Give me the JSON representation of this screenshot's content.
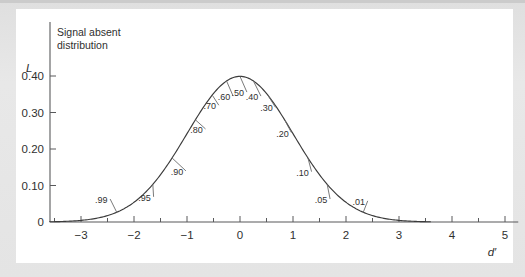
{
  "figure": {
    "title_line1": "Signal absent",
    "title_line2": "distribution",
    "background_color": "#e6e6e6",
    "panel_color": "#ffffff",
    "curve_color": "#3b3b3b",
    "axis_color": "#58595b"
  },
  "chart_data": {
    "type": "line",
    "xlabel": "d′",
    "ylabel": "L",
    "xlim": [
      -3.6,
      5.25
    ],
    "ylim": [
      0,
      0.46
    ],
    "grid": false,
    "legend": "none",
    "x_ticks": [
      -3,
      -2,
      -1,
      0,
      1,
      2,
      3,
      4,
      5
    ],
    "x_tick_labels": [
      "−3",
      "−2",
      "−1",
      "0",
      "1",
      "2",
      "3",
      "4",
      "5"
    ],
    "x_minor_ticks": [
      -3.5,
      -2.5,
      -1.5,
      -0.5,
      0.5,
      1.5,
      2.5,
      3.5,
      4.5
    ],
    "y_ticks": [
      0,
      0.1,
      0.2,
      0.3,
      0.4
    ],
    "y_tick_labels": [
      "0",
      "0.10",
      "0.20",
      "0.30",
      "0.40"
    ],
    "series": [
      {
        "name": "Signal absent distribution",
        "description": "standard normal probability density, mean 0, sd 1",
        "x": [
          -3.6,
          -3.4,
          -3.2,
          -3.0,
          -2.8,
          -2.6,
          -2.4,
          -2.2,
          -2.0,
          -1.8,
          -1.6,
          -1.4,
          -1.2,
          -1.0,
          -0.8,
          -0.6,
          -0.4,
          -0.2,
          0.0,
          0.2,
          0.4,
          0.6,
          0.8,
          1.0,
          1.2,
          1.4,
          1.6,
          1.8,
          2.0,
          2.2,
          2.4,
          2.6,
          2.8,
          3.0,
          3.2,
          3.4,
          3.6
        ],
        "y": [
          0.0006,
          0.0012,
          0.0024,
          0.0044,
          0.0079,
          0.0136,
          0.0224,
          0.0355,
          0.054,
          0.079,
          0.1109,
          0.1497,
          0.1942,
          0.242,
          0.2897,
          0.3332,
          0.3683,
          0.391,
          0.3989,
          0.391,
          0.3683,
          0.3332,
          0.2897,
          0.242,
          0.1942,
          0.1497,
          0.1109,
          0.079,
          0.054,
          0.0355,
          0.0224,
          0.0136,
          0.0079,
          0.0044,
          0.0024,
          0.0012,
          0.0006
        ]
      }
    ],
    "annotations": [
      {
        "label": ".99",
        "criterion_x": -2.326,
        "density_y": 0.0267,
        "text_x": -2.62,
        "text_y": 0.052
      },
      {
        "label": ".95",
        "criterion_x": -1.645,
        "density_y": 0.1031,
        "text_x": -1.8,
        "text_y": 0.058
      },
      {
        "label": ".90",
        "criterion_x": -1.282,
        "density_y": 0.1755,
        "text_x": -1.19,
        "text_y": 0.129
      },
      {
        "label": ".80",
        "criterion_x": -0.842,
        "density_y": 0.28,
        "text_x": -0.82,
        "text_y": 0.244
      },
      {
        "label": ".70",
        "criterion_x": -0.524,
        "density_y": 0.3477,
        "text_x": -0.57,
        "text_y": 0.309
      },
      {
        "label": ".60",
        "criterion_x": -0.253,
        "density_y": 0.3863,
        "text_x": -0.3,
        "text_y": 0.334
      },
      {
        "label": ".50",
        "criterion_x": 0.0,
        "density_y": 0.3989,
        "text_x": -0.04,
        "text_y": 0.345
      },
      {
        "label": ".40",
        "criterion_x": 0.253,
        "density_y": 0.3863,
        "text_x": 0.225,
        "text_y": 0.334
      },
      {
        "label": ".30",
        "criterion_x": 0.524,
        "density_y": 0.3477,
        "text_x": 0.5,
        "text_y": 0.303
      },
      {
        "label": ".20",
        "criterion_x": 0.842,
        "density_y": 0.28,
        "text_x": 0.8,
        "text_y": 0.234
      },
      {
        "label": ".10",
        "criterion_x": 1.282,
        "density_y": 0.1755,
        "text_x": 1.18,
        "text_y": 0.127
      },
      {
        "label": ".05",
        "criterion_x": 1.645,
        "density_y": 0.1031,
        "text_x": 1.53,
        "text_y": 0.052
      },
      {
        "label": ".01",
        "criterion_x": 2.326,
        "density_y": 0.0267,
        "text_x": 2.24,
        "text_y": 0.047
      }
    ]
  }
}
